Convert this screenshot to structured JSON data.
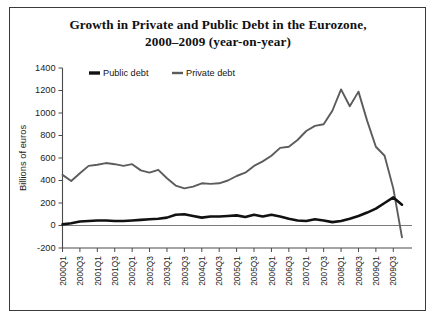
{
  "figure": {
    "title_lines": [
      "Growth in Private and Public Debt in the Eurozone,",
      "2000–2009 (year-on-year)"
    ],
    "border_color": "#3a3a3a",
    "background": "#ffffff"
  },
  "chart_data": {
    "type": "line",
    "title": "Growth in Private and Public Debt in the Eurozone, 2000–2009 (year-on-year)",
    "xlabel": "",
    "ylabel": "Billions of euros",
    "ylim": [
      -200,
      1400
    ],
    "ytick_step": 200,
    "yticks": [
      -200,
      0,
      200,
      400,
      600,
      800,
      1000,
      1200,
      1400
    ],
    "ytick_labels": [
      "-200",
      "0",
      "200",
      "400",
      "600",
      "800",
      "1000",
      "1200",
      "1400"
    ],
    "grid": false,
    "zero_line": true,
    "legend_position": "top-left-inside",
    "x": [
      "2000Q1",
      "2000Q2",
      "2000Q3",
      "2000Q4",
      "2001Q1",
      "2001Q2",
      "2001Q3",
      "2001Q4",
      "2002Q1",
      "2002Q2",
      "2002Q3",
      "2002Q4",
      "2003Q1",
      "2003Q2",
      "2003Q3",
      "2003Q4",
      "2004Q1",
      "2004Q2",
      "2004Q3",
      "2004Q4",
      "2005Q1",
      "2005Q2",
      "2005Q3",
      "2005Q4",
      "2006Q1",
      "2006Q2",
      "2006Q3",
      "2006Q4",
      "2007Q1",
      "2007Q2",
      "2007Q3",
      "2007Q4",
      "2008Q1",
      "2008Q2",
      "2008Q3",
      "2008Q4",
      "2009Q1",
      "2009Q2",
      "2009Q3",
      "2009Q4"
    ],
    "xtick_labels": [
      "2000Q1",
      "2000Q3",
      "2001Q1",
      "2001Q3",
      "2002Q1",
      "2002Q3",
      "2003Q1",
      "2003Q3",
      "2004Q1",
      "2004Q3",
      "2005Q1",
      "2005Q3",
      "2006Q1",
      "2006Q3",
      "2007Q1",
      "2007Q3",
      "2008Q1",
      "2008Q3",
      "2009Q1",
      "2009Q3"
    ],
    "xtick_every": 2,
    "series": [
      {
        "name": "Public debt",
        "color": "#111111",
        "line_width": 2.6,
        "values": [
          10,
          20,
          35,
          40,
          45,
          45,
          40,
          40,
          45,
          50,
          55,
          60,
          70,
          95,
          100,
          85,
          70,
          80,
          80,
          85,
          90,
          75,
          95,
          80,
          95,
          80,
          60,
          45,
          40,
          55,
          45,
          30,
          40,
          60,
          85,
          115,
          150,
          200,
          250,
          185
        ]
      },
      {
        "name": "Private debt",
        "color": "#5c5c5c",
        "line_width": 1.9,
        "values": [
          450,
          395,
          465,
          530,
          540,
          555,
          545,
          530,
          545,
          490,
          470,
          495,
          420,
          355,
          330,
          345,
          375,
          370,
          375,
          400,
          440,
          470,
          530,
          570,
          620,
          690,
          700,
          760,
          840,
          885,
          900,
          1020,
          1210,
          1060,
          1190,
          930,
          700,
          620,
          330,
          -105
        ]
      }
    ],
    "legend": [
      {
        "label": "Public debt",
        "color": "#111111",
        "marker": "line-thick"
      },
      {
        "label": "Private debt",
        "color": "#5c5c5c",
        "marker": "line-thin"
      }
    ]
  }
}
